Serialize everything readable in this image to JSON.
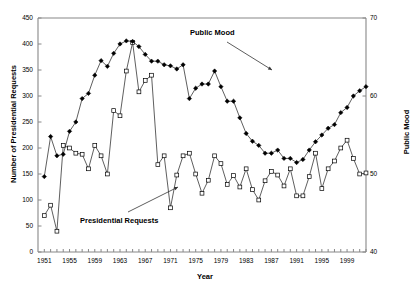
{
  "chart_data": {
    "type": "line",
    "title": "",
    "xlabel": "Year",
    "ylabel": "Number of Presidential Requests",
    "ylabel_right": "Public Mood",
    "grid": false,
    "legend_position": "none",
    "xlim": [
      1950,
      2002
    ],
    "ylim": [
      0,
      450
    ],
    "ylim_right": [
      40,
      70
    ],
    "ytick_labels": [
      "0",
      "50",
      "100",
      "150",
      "200",
      "250",
      "300",
      "350",
      "400",
      "450"
    ],
    "ytick_values": [
      0,
      50,
      100,
      150,
      200,
      250,
      300,
      350,
      400,
      450
    ],
    "ytick_right_labels": [
      "40",
      "50",
      "60",
      "70"
    ],
    "ytick_right_values": [
      40,
      50,
      60,
      70
    ],
    "xtick_labels": [
      "1951",
      "1955",
      "1959",
      "1963",
      "1967",
      "1971",
      "1975",
      "1979",
      "1983",
      "1987",
      "1991",
      "1995",
      "1999"
    ],
    "xtick_values": [
      1951,
      1955,
      1959,
      1963,
      1967,
      1971,
      1975,
      1979,
      1983,
      1987,
      1991,
      1995,
      1999
    ],
    "xtick_minor_step": 1,
    "annotations": [
      {
        "text": "Public Mood",
        "x": 1982,
        "y": 330
      },
      {
        "text": "Presidential Requests",
        "x": 1962,
        "y": 72
      }
    ],
    "series": [
      {
        "name": "Presidential Requests",
        "marker": "open-square",
        "axis": "left",
        "x": [
          1951,
          1952,
          1953,
          1954,
          1955,
          1956,
          1957,
          1958,
          1959,
          1960,
          1961,
          1962,
          1963,
          1964,
          1965,
          1966,
          1967,
          1968,
          1969,
          1970,
          1971,
          1972,
          1973,
          1974,
          1975,
          1976,
          1977,
          1978,
          1979,
          1980,
          1981,
          1982,
          1983,
          1984,
          1985,
          1986,
          1987,
          1988,
          1989,
          1990,
          1991,
          1992,
          1993,
          1994,
          1995,
          1996,
          1997,
          1998,
          1999,
          2000,
          2001,
          2002
        ],
        "y": [
          70,
          90,
          40,
          205,
          200,
          190,
          188,
          160,
          205,
          185,
          150,
          272,
          262,
          348,
          403,
          308,
          330,
          340,
          168,
          185,
          85,
          148,
          185,
          190,
          150,
          113,
          138,
          185,
          170,
          130,
          147,
          125,
          160,
          120,
          100,
          137,
          155,
          148,
          127,
          160,
          108,
          108,
          145,
          190,
          122,
          160,
          175,
          200,
          215,
          180,
          150,
          152
        ]
      },
      {
        "name": "Public Mood",
        "marker": "filled-diamond",
        "axis": "right",
        "x": [
          1951,
          1952,
          1953,
          1954,
          1955,
          1956,
          1957,
          1958,
          1959,
          1960,
          1961,
          1962,
          1963,
          1964,
          1965,
          1966,
          1967,
          1968,
          1969,
          1970,
          1971,
          1972,
          1973,
          1974,
          1975,
          1976,
          1977,
          1978,
          1979,
          1980,
          1981,
          1982,
          1983,
          1984,
          1985,
          1986,
          1987,
          1988,
          1989,
          1990,
          1991,
          1992,
          1993,
          1994,
          1995,
          1996,
          1997,
          1998,
          1999,
          2000,
          2001,
          2002
        ],
        "y_left_scale": [
          145,
          222,
          185,
          188,
          232,
          250,
          295,
          305,
          340,
          368,
          357,
          382,
          400,
          406,
          405,
          395,
          380,
          367,
          367,
          360,
          358,
          352,
          360,
          295,
          315,
          323,
          323,
          348,
          318,
          290,
          290,
          258,
          228,
          213,
          205,
          190,
          190,
          196,
          180,
          180,
          172,
          178,
          196,
          212,
          225,
          238,
          245,
          268,
          278,
          300,
          310,
          318
        ],
        "y": [
          49.7,
          54.8,
          52.3,
          52.5,
          55.5,
          56.7,
          59.7,
          60.3,
          62.7,
          64.5,
          63.8,
          65.5,
          66.7,
          67.1,
          67.0,
          66.3,
          65.3,
          64.5,
          64.5,
          64.0,
          63.9,
          63.5,
          64.0,
          59.7,
          61.0,
          61.5,
          61.5,
          63.2,
          61.2,
          59.3,
          59.3,
          57.2,
          55.2,
          54.2,
          53.7,
          52.7,
          52.7,
          53.1,
          52.0,
          52.0,
          51.5,
          51.9,
          53.1,
          54.1,
          55.0,
          55.9,
          56.3,
          57.9,
          58.6,
          60.0,
          60.7,
          61.2
        ]
      }
    ]
  }
}
